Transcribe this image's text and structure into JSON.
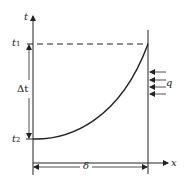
{
  "diagram": {
    "axes": {
      "vertical_label": "t",
      "horizontal_label": "x"
    },
    "levels": {
      "top": {
        "base": "t",
        "sub": "1"
      },
      "bottom": {
        "base": "t",
        "sub": "2"
      }
    },
    "difference_label": "Δt",
    "thickness_label": "δ",
    "heat_flux_label": "q",
    "colors": {
      "line": "#222222",
      "background": "#ffffff"
    }
  }
}
